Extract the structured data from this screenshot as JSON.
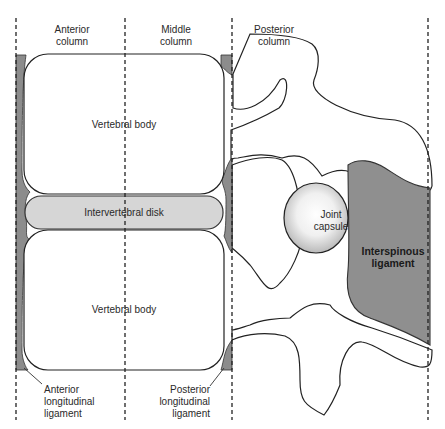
{
  "diagram": {
    "columns": [
      {
        "id": "anterior",
        "label_line1": "Anterior",
        "label_line2": "column"
      },
      {
        "id": "middle",
        "label_line1": "Middle",
        "label_line2": "column"
      },
      {
        "id": "posterior",
        "label_line1": "Posterior",
        "label_line2": "column"
      }
    ],
    "structures": {
      "upper_body": "Vertebral body",
      "disk": "Intervertebral disk",
      "lower_body": "Vertebral body",
      "joint_capsule_line1": "Joint",
      "joint_capsule_line2": "capsule",
      "interspinous_line1": "Interspinous",
      "interspinous_line2": "ligament"
    },
    "callouts": {
      "anterior_ligament": [
        "Anterior",
        "longitudinal",
        "ligament"
      ],
      "posterior_ligament": [
        "Posterior",
        "longitudinal",
        "ligament"
      ]
    },
    "colors": {
      "ligament_fill": "#8c8c8c",
      "disk_fill": "#d6d6d6",
      "interspinous_fill": "#8f8f8f",
      "outline": "#222222"
    }
  }
}
